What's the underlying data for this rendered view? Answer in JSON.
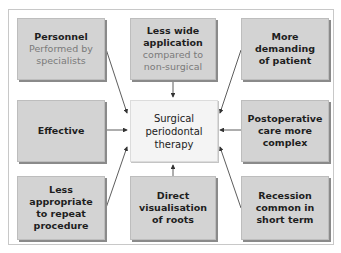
{
  "diagram": {
    "center": {
      "lines": [
        "Surgical",
        "periodontal",
        "therapy"
      ]
    },
    "nodes": [
      {
        "id": "personnel",
        "position": "top-left",
        "title_lines": [
          "Personnel"
        ],
        "subtitle_lines": [
          "Performed by",
          "specialists"
        ]
      },
      {
        "id": "less-wide-application",
        "position": "top-center",
        "title_lines": [
          "Less wide",
          "application"
        ],
        "subtitle_lines": [
          "compared to",
          "non-surgical"
        ]
      },
      {
        "id": "more-demanding",
        "position": "top-right",
        "title_lines": [
          "More",
          "demanding",
          "of patient"
        ],
        "subtitle_lines": []
      },
      {
        "id": "effective",
        "position": "middle-left",
        "title_lines": [
          "Effective"
        ],
        "subtitle_lines": []
      },
      {
        "id": "postoperative-care",
        "position": "middle-right",
        "title_lines": [
          "Postoperative",
          "care more",
          "complex"
        ],
        "subtitle_lines": []
      },
      {
        "id": "less-appropriate",
        "position": "bottom-left",
        "title_lines": [
          "Less",
          "appropriate",
          "to repeat",
          "procedure"
        ],
        "subtitle_lines": []
      },
      {
        "id": "direct-visualisation",
        "position": "bottom-center",
        "title_lines": [
          "Direct",
          "visualisation",
          "of roots"
        ],
        "subtitle_lines": []
      },
      {
        "id": "recession",
        "position": "bottom-right",
        "title_lines": [
          "Recession",
          "common in",
          "short term"
        ],
        "subtitle_lines": []
      }
    ],
    "edges_direction": "all nodes point to center",
    "colors": {
      "node_fill": "#d3d3d3",
      "center_fill": "#f4f4f4",
      "subtitle_text": "#7a7a7a",
      "title_text": "#1e1e1e",
      "arrow": "#333333"
    }
  }
}
